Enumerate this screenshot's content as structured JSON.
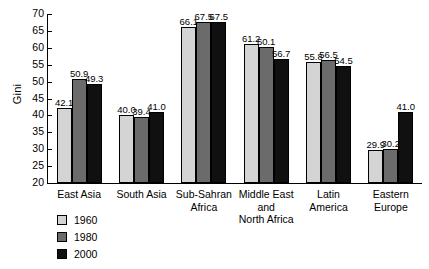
{
  "chart_data": {
    "type": "bar",
    "title": "",
    "xlabel": "",
    "ylabel": "Gini",
    "ylim": [
      20,
      70
    ],
    "yticks": [
      20,
      25,
      30,
      35,
      40,
      45,
      50,
      55,
      60,
      65,
      70
    ],
    "grid": false,
    "legend_position": "bottom-left",
    "categories": [
      "East Asia",
      "South Asia",
      "Sub-Sahran\nAfrica",
      "Middle East\nand\nNorth Africa",
      "Latin\nAmerica",
      "Eastern\nEurope"
    ],
    "series": [
      {
        "name": "1960",
        "color": "#d4d4d4",
        "values": [
          42.1,
          40.0,
          66.1,
          61.2,
          55.8,
          29.9
        ],
        "labels": [
          "42.1",
          "40.0",
          "66.1",
          "61.2",
          "55.8",
          "29.9"
        ]
      },
      {
        "name": "1980",
        "color": "#6b6b6b",
        "values": [
          50.9,
          39.4,
          67.5,
          60.1,
          56.5,
          30.2
        ],
        "labels": [
          "50.9",
          "39.4",
          "67.5",
          "60.1",
          "56.5",
          "30.2"
        ]
      },
      {
        "name": "2000",
        "color": "#101010",
        "values": [
          49.3,
          41.0,
          67.5,
          56.7,
          54.5,
          41.0
        ],
        "labels": [
          "49.3",
          "41.0",
          "67.5",
          "56.7",
          "54.5",
          "41.0"
        ]
      }
    ]
  }
}
